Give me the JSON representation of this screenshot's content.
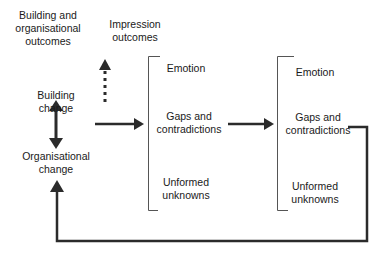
{
  "diagram": {
    "colors": {
      "line": "#2b2b2b",
      "bracket": "#555555",
      "text": "#1a1a1a",
      "background": "#ffffff"
    },
    "labels": {
      "building_org_outcomes": "Building and\norganisational\noutcomes",
      "impression_outcomes": "Impression\noutcomes",
      "building_change": "Building\nchange",
      "organisational_change": "Organisational\nchange"
    },
    "group_1": {
      "emotion": "Emotion",
      "gaps": "Gaps and\ncontradictions",
      "unknowns": "Unformed\nunknowns"
    },
    "group_2": {
      "emotion": "Emotion",
      "gaps": "Gaps and\ncontradictions",
      "unknowns": "Unformed\nunknowns"
    },
    "edges": [
      {
        "from": "building_change",
        "to": "organisational_change",
        "style": "double-arrow"
      },
      {
        "from": "building_change",
        "to": "impression_outcomes",
        "style": "dotted-arrow"
      },
      {
        "from": "building_change",
        "to": "group_1",
        "style": "solid-arrow"
      },
      {
        "from": "group_1",
        "to": "group_2",
        "style": "solid-arrow"
      },
      {
        "from": "group_2",
        "to": "organisational_change",
        "style": "solid-feedback-arrow"
      }
    ]
  }
}
